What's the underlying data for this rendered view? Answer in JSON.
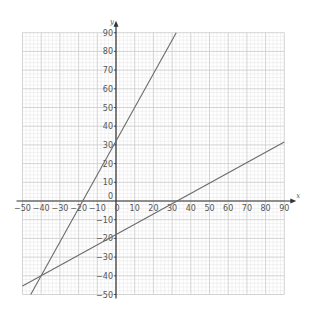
{
  "chart_data": {
    "type": "line",
    "title": "",
    "xlabel": "x",
    "ylabel": "y",
    "xlim": [
      -50,
      90
    ],
    "ylim": [
      -50,
      90
    ],
    "grid": true,
    "grid_major_step": 10,
    "grid_minor_step": 2,
    "x_ticks": [
      -50,
      -40,
      -30,
      -20,
      -10,
      0,
      10,
      20,
      30,
      40,
      50,
      60,
      70,
      80,
      90
    ],
    "y_ticks": [
      -50,
      -40,
      -30,
      -20,
      -10,
      0,
      10,
      20,
      30,
      40,
      50,
      60,
      70,
      80,
      90
    ],
    "series": [
      {
        "name": "steep line",
        "slope": 1.8,
        "intercept": 32,
        "points": [
          [
            -45.6,
            -50
          ],
          [
            -40,
            -40
          ],
          [
            -17.8,
            0
          ],
          [
            0,
            32
          ],
          [
            32.2,
            90
          ]
        ],
        "color": "#6b6b6b"
      },
      {
        "name": "shallow line",
        "slope": 0.55,
        "intercept": -18,
        "points": [
          [
            -50,
            -45.5
          ],
          [
            -40,
            -40
          ],
          [
            0,
            -18
          ],
          [
            32.7,
            0
          ],
          [
            90,
            31.5
          ]
        ],
        "color": "#6b6b6b"
      }
    ],
    "intersection": [
      -40,
      -40
    ],
    "legend": null
  },
  "colors": {
    "minor_grid": "#e4e4e4",
    "major_grid": "#c9c9c9",
    "axis": "#333333",
    "line": "#6b6b6b",
    "text": "#555555"
  }
}
